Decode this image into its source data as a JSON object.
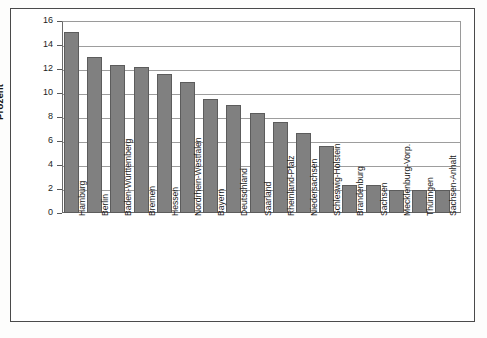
{
  "chart_data": {
    "type": "bar",
    "title": "",
    "subtitle": "",
    "xlabel": "",
    "ylabel": "Prozent",
    "ylim": [
      0,
      16
    ],
    "ytick_step": 2,
    "yticks": [
      "16",
      "14",
      "12",
      "10",
      "8",
      "6",
      "4",
      "2",
      "0"
    ],
    "grid": true,
    "legend": "none",
    "bar_color": "#808080",
    "bar_edge_color": "#5c5c5c",
    "categories": [
      "Hamburg",
      "Berlin",
      "Baden-Württemberg",
      "Bremen",
      "Hessen",
      "Nordrhein-Westfalen",
      "Bayern",
      "Deutschland",
      "Saarland",
      "Rheinland-Pfalz",
      "Niedersachsen",
      "Schleswig-Holstein",
      "Brandenburg",
      "Sachsen",
      "Mecklenburg-Vorp.",
      "Thüringen",
      "Sachsen-Anhalt"
    ],
    "values": [
      15.1,
      13.0,
      12.3,
      12.2,
      11.6,
      10.9,
      9.5,
      9.0,
      8.3,
      7.6,
      6.7,
      5.6,
      2.3,
      2.3,
      1.9,
      1.9,
      1.9
    ]
  }
}
